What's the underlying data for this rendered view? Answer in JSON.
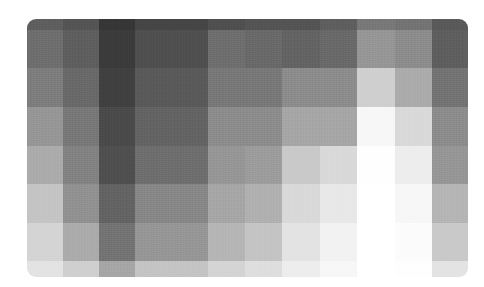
{
  "chart_data": {
    "type": "heatmap",
    "title": "",
    "xlabel": "",
    "ylabel": "",
    "colormap": "grayscale",
    "value_meaning": "luminance 0 (black) to 255 (white)",
    "grid": false,
    "legend": null,
    "column_edges_px": [
      27,
      63,
      99,
      135,
      172,
      208,
      245,
      282,
      320,
      357,
      395,
      432,
      468
    ],
    "row_edges_px": [
      19,
      30,
      68,
      107,
      146,
      184,
      223,
      261,
      277
    ],
    "n_rows": 8,
    "n_cols": 12,
    "values": [
      [
        95,
        85,
        55,
        70,
        70,
        80,
        85,
        85,
        95,
        120,
        115,
        90
      ],
      [
        110,
        95,
        60,
        80,
        80,
        110,
        105,
        100,
        105,
        150,
        140,
        95
      ],
      [
        125,
        105,
        65,
        90,
        90,
        120,
        120,
        140,
        140,
        205,
        170,
        115
      ],
      [
        150,
        120,
        75,
        100,
        100,
        140,
        140,
        165,
        165,
        245,
        215,
        140
      ],
      [
        170,
        130,
        80,
        110,
        110,
        150,
        155,
        200,
        215,
        252,
        235,
        150
      ],
      [
        195,
        145,
        100,
        135,
        135,
        165,
        175,
        215,
        230,
        254,
        245,
        180
      ],
      [
        210,
        170,
        115,
        150,
        150,
        180,
        195,
        225,
        240,
        255,
        250,
        200
      ],
      [
        225,
        205,
        165,
        195,
        195,
        210,
        220,
        235,
        245,
        255,
        252,
        225
      ]
    ]
  }
}
